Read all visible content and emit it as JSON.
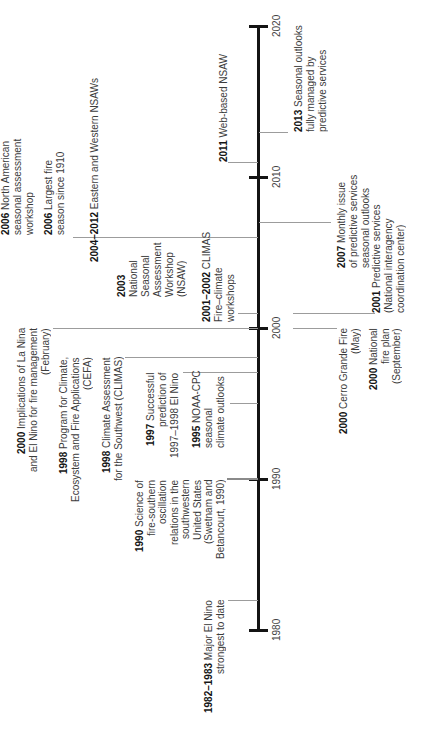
{
  "axis": {
    "ticks": [
      "1980",
      "1990",
      "2000",
      "2010",
      "2020"
    ]
  },
  "events": [
    {
      "year": "2006",
      "lines": [
        "North American",
        "seasonal assessment",
        "workshop"
      ]
    },
    {
      "year": "2006",
      "lines": [
        "Largest fire",
        "season since 1910"
      ]
    },
    {
      "year": "2004–2012",
      "lines": [
        "Eastern and Western NSAWs"
      ]
    },
    {
      "year": "2003",
      "lines": [
        "",
        "National",
        "Seasonal",
        "Assessment",
        "Workshop",
        "(NSAW)"
      ]
    },
    {
      "year": "2001–2002",
      "lines": [
        "CLIMAS",
        "Fire–climate",
        "workshops"
      ]
    },
    {
      "year": "2000",
      "lines": [
        "Implications of La Nina",
        "and El Nino for fire management",
        "(February)"
      ]
    },
    {
      "year": "1998",
      "lines": [
        "Program for Climate,",
        "Ecosystem and Fire Applications",
        "(CEFA)"
      ]
    },
    {
      "year": "1998",
      "lines": [
        "Climate Assessment",
        "for the Southwest (CLIMAS)"
      ]
    },
    {
      "year": "1997",
      "lines": [
        "Successful",
        "prediction of",
        "1997–1998 El Nino"
      ]
    },
    {
      "year": "1995",
      "lines": [
        "NOAA-CPC",
        "seasonal",
        "climate outlooks"
      ]
    },
    {
      "year": "1990",
      "lines": [
        "Science of",
        "fire-southern",
        "oscillation",
        "relations in the",
        "southwestern",
        "United States",
        "(Swetnam and",
        "Betancourt, 1990)"
      ]
    },
    {
      "year": "1982–1983",
      "lines": [
        "Major El Nino",
        "strongest to date"
      ]
    },
    {
      "year": "2013",
      "lines": [
        "Seasonal outlooks",
        "fully managed by",
        "predictive services"
      ]
    },
    {
      "year": "2011",
      "lines": [
        "Web-based NSAW"
      ]
    },
    {
      "year": "2007",
      "lines": [
        "Monthly issue",
        "of predictive services",
        "seasonal outlooks"
      ]
    },
    {
      "year": "2001",
      "lines": [
        "Predictive services",
        "(National interagency",
        "coordination center)"
      ]
    },
    {
      "year": "2000",
      "lines": [
        "Cerro Grande Fire",
        "(May)"
      ]
    },
    {
      "year": "2000",
      "lines": [
        "National",
        "fire plan",
        "(September)"
      ]
    }
  ]
}
